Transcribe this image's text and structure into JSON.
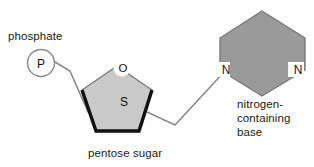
{
  "diagram": {
    "background_color": "#ffffff",
    "labels": {
      "phosphate": "phosphate",
      "pentose_sugar": "pentose sugar",
      "nitrogen_base_line1": "nitrogen-",
      "nitrogen_base_line2": "containing",
      "nitrogen_base_line3": "base"
    },
    "atoms": {
      "phosphorus": "P",
      "oxygen": "O",
      "sugar": "S",
      "nitrogen_left": "N",
      "nitrogen_right": "N"
    },
    "colors": {
      "pentose_fill": "#c9c9c9",
      "base_fill": "#9a9a9a",
      "shape_outline": "#7a7a7a",
      "thick_edge": "#111111",
      "bond_line": "#8a8a8a",
      "text": "#1a1a1a",
      "circle_fill": "#ffffff"
    }
  }
}
